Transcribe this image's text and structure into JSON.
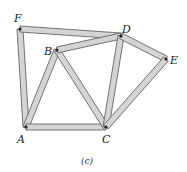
{
  "figure": {
    "caption": "(c)",
    "joints": [
      {
        "id": "A",
        "x": 26,
        "y": 127
      },
      {
        "id": "B",
        "x": 57,
        "y": 50
      },
      {
        "id": "C",
        "x": 106,
        "y": 127
      },
      {
        "id": "D",
        "x": 121,
        "y": 36
      },
      {
        "id": "E",
        "x": 166,
        "y": 59
      },
      {
        "id": "F",
        "x": 20,
        "y": 29
      }
    ],
    "members": [
      [
        "F",
        "A"
      ],
      [
        "F",
        "D"
      ],
      [
        "A",
        "B"
      ],
      [
        "A",
        "C"
      ],
      [
        "B",
        "C"
      ],
      [
        "B",
        "D"
      ],
      [
        "D",
        "C"
      ],
      [
        "D",
        "E"
      ],
      [
        "E",
        "C"
      ]
    ],
    "labels": {
      "A": "A",
      "B": "B",
      "C": "C",
      "D": "D",
      "E": "E",
      "F": "F"
    },
    "colors": {
      "member_fill": "#d4d4d4",
      "member_edge": "#555555",
      "pin": "#222222"
    }
  }
}
